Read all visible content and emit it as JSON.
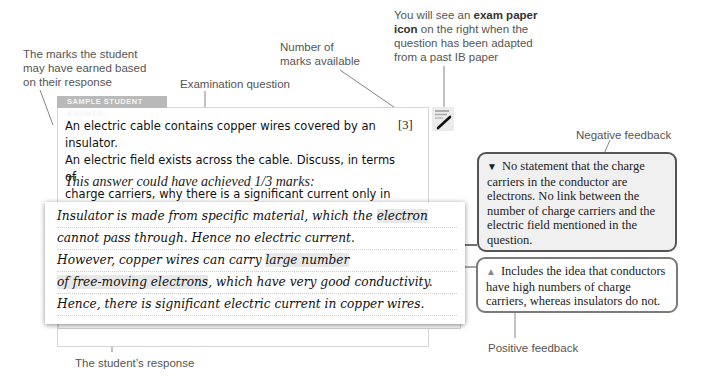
{
  "annotations": {
    "marks_earned": [
      "The marks the student",
      "may have earned based",
      "on their response"
    ],
    "marks_available": [
      "Number of",
      "marks available"
    ],
    "exam_question": "Examination question",
    "exam_icon_note": {
      "prefix": "You will see an",
      "bold1": "exam paper",
      "bold2": "icon",
      "rest1": "on the right when the",
      "line3": "question has been adapted",
      "line4": "from a past IB paper"
    },
    "negative_feedback": "Negative feedback",
    "positive_feedback": "Positive feedback",
    "student_response": "The student’s response"
  },
  "card": {
    "tab_label": "SAMPLE STUDENT ANSWER",
    "question_lines": [
      "An electric cable contains copper wires covered by an insulator.",
      "An electric field exists across the cable. Discuss, in terms of",
      "charge carriers, why there is a significant current only in the copper."
    ],
    "marks": "[3]",
    "exam_icon": "exam-paper-pencil-icon",
    "achieved": "This answer could have achieved 1/3 marks:"
  },
  "response": {
    "lines": [
      {
        "pre": "Insulator is made from specific material, which the ",
        "hl": "electron",
        "post": ""
      },
      {
        "pre": "cannot pass through. Hence no electric current.",
        "hl": "",
        "post": ""
      },
      {
        "pre": "However, copper wires can carry ",
        "hl": "large number",
        "post": ""
      },
      {
        "pre": "",
        "hl": "of free-moving electrons",
        "post": ", which have very good conductivity."
      },
      {
        "pre": "Hence, there is significant electric current in copper wires.",
        "hl": "",
        "post": ""
      }
    ]
  },
  "feedback": {
    "negative": {
      "icon": "down-triangle-icon",
      "symbol": "▼",
      "text": "No statement that the charge carriers in the conductor are electrons. No link between the number of charge carriers and the electric field mentioned in the question."
    },
    "positive": {
      "icon": "up-triangle-icon",
      "symbol": "▲",
      "text": "Includes the idea that conductors have high numbers of charge carriers, whereas insulators do not."
    }
  },
  "colors": {
    "tab_bg": "#b9b9b9",
    "negative_border": "#555555",
    "negative_bg": "#f0f0f0",
    "positive_border": "#7a7a7a",
    "highlight": "#e8e8e8"
  }
}
